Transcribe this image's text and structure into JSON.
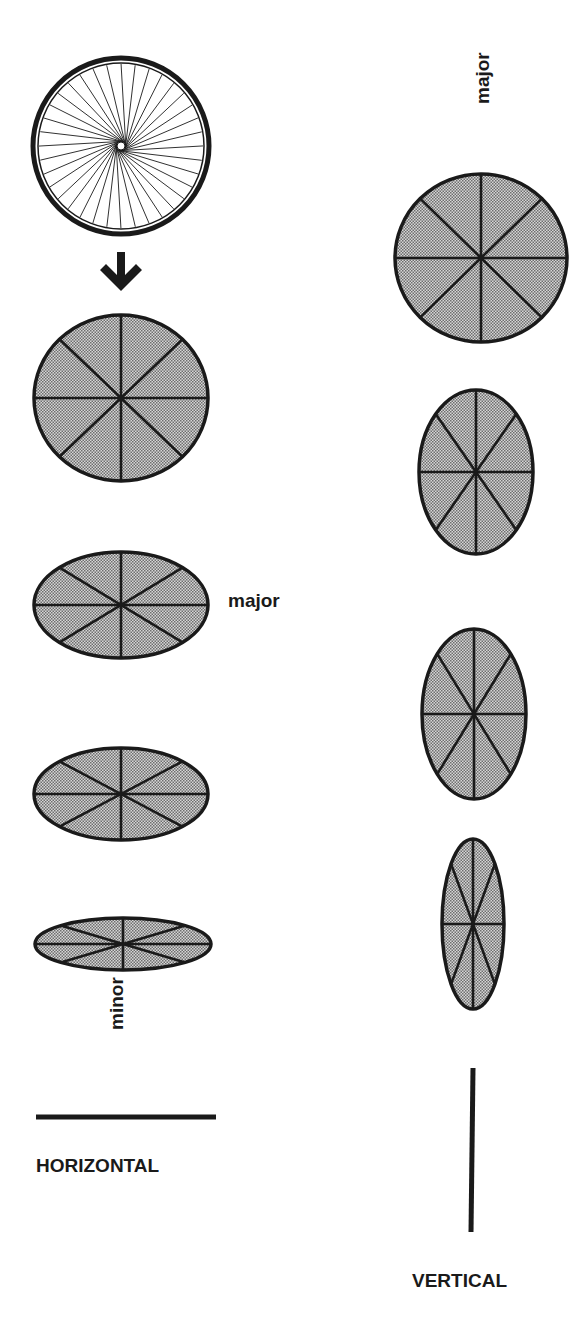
{
  "diagram": {
    "colors": {
      "ink": "#1a1a1a",
      "fill_dark": "#8a8a8a",
      "fill_light": "#d8d8d8",
      "background": "#ffffff"
    },
    "labels": {
      "major_horizontal": "major",
      "minor": "minor",
      "major_vertical": "major",
      "horizontal": "HORIZONTAL",
      "vertical": "VERTICAL"
    },
    "icons": {
      "wheel": "bicycle-wheel-icon",
      "arrow": "arrow-down-icon"
    },
    "wheel": {
      "cx": 121,
      "cy": 146,
      "r": 88,
      "spokes": 36
    },
    "arrow": {
      "x": 121,
      "y": 272
    },
    "horizontal_column": [
      {
        "cx": 121,
        "cy": 398,
        "rx": 87,
        "ry": 83
      },
      {
        "cx": 121,
        "cy": 605,
        "rx": 87,
        "ry": 53
      },
      {
        "cx": 121,
        "cy": 794,
        "rx": 87,
        "ry": 46
      },
      {
        "cx": 123,
        "cy": 944,
        "rx": 88,
        "ry": 26
      }
    ],
    "horizontal_line": {
      "x1": 36,
      "y1": 1117,
      "x2": 216,
      "y2": 1117
    },
    "vertical_column": [
      {
        "cx": 481,
        "cy": 258,
        "rx": 86,
        "ry": 84
      },
      {
        "cx": 476,
        "cy": 472,
        "rx": 57,
        "ry": 82
      },
      {
        "cx": 474,
        "cy": 714,
        "rx": 52,
        "ry": 85
      },
      {
        "cx": 473,
        "cy": 924,
        "rx": 31,
        "ry": 85
      }
    ],
    "vertical_line": {
      "x1": 473,
      "y1": 1068,
      "x2": 471,
      "y2": 1232
    }
  }
}
